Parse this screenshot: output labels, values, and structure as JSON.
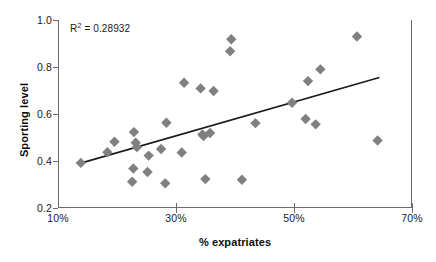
{
  "chart_data": {
    "type": "scatter",
    "title": "",
    "xlabel": "% expatriates",
    "ylabel": "Sporting level",
    "xlim": [
      10,
      70
    ],
    "ylim": [
      0.2,
      1.0
    ],
    "xticks": [
      "10%",
      "30%",
      "50%",
      "70%"
    ],
    "xtick_values": [
      10,
      30,
      50,
      70
    ],
    "yticks": [
      "0.2",
      "0.4",
      "0.6",
      "0.8",
      "1.0"
    ],
    "ytick_values": [
      0.2,
      0.4,
      0.6,
      0.8,
      1.0
    ],
    "grid": false,
    "legend": null,
    "marker": {
      "shape": "diamond",
      "color": "#808080",
      "size": 9
    },
    "annotations": [
      {
        "name": "r-squared",
        "text_prefix": "R",
        "text_sup": "2",
        "text_suffix": " = 0.28932",
        "full_text": "R2 = 0.28932",
        "value": 0.28932,
        "x": 13.5,
        "y": 0.955
      }
    ],
    "trendline": {
      "type": "linear",
      "color": "#1a1a1a",
      "width": 1.6,
      "x_start": 13.7,
      "y_start": 0.391,
      "x_end": 64.3,
      "y_end": 0.755
    },
    "points": [
      {
        "x": 13.7,
        "y": 0.392
      },
      {
        "x": 18.2,
        "y": 0.437
      },
      {
        "x": 19.4,
        "y": 0.482
      },
      {
        "x": 22.4,
        "y": 0.312
      },
      {
        "x": 22.6,
        "y": 0.368
      },
      {
        "x": 22.7,
        "y": 0.523
      },
      {
        "x": 23.0,
        "y": 0.478
      },
      {
        "x": 23.2,
        "y": 0.459
      },
      {
        "x": 25.0,
        "y": 0.353
      },
      {
        "x": 25.2,
        "y": 0.423
      },
      {
        "x": 27.3,
        "y": 0.451
      },
      {
        "x": 28.0,
        "y": 0.305
      },
      {
        "x": 28.2,
        "y": 0.563
      },
      {
        "x": 30.8,
        "y": 0.436
      },
      {
        "x": 31.2,
        "y": 0.733
      },
      {
        "x": 34.0,
        "y": 0.709
      },
      {
        "x": 34.3,
        "y": 0.513
      },
      {
        "x": 34.5,
        "y": 0.506
      },
      {
        "x": 34.8,
        "y": 0.323
      },
      {
        "x": 35.6,
        "y": 0.519
      },
      {
        "x": 36.2,
        "y": 0.698
      },
      {
        "x": 39.0,
        "y": 0.867
      },
      {
        "x": 39.2,
        "y": 0.918
      },
      {
        "x": 41.0,
        "y": 0.32
      },
      {
        "x": 43.3,
        "y": 0.561
      },
      {
        "x": 49.5,
        "y": 0.648
      },
      {
        "x": 51.8,
        "y": 0.579
      },
      {
        "x": 52.2,
        "y": 0.74
      },
      {
        "x": 53.5,
        "y": 0.556
      },
      {
        "x": 54.3,
        "y": 0.79
      },
      {
        "x": 60.5,
        "y": 0.93
      },
      {
        "x": 64.0,
        "y": 0.487
      }
    ]
  }
}
